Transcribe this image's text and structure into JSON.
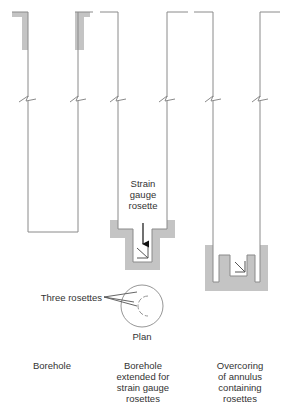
{
  "colors": {
    "line": "#8a8a8a",
    "shade": "#c4c4c4",
    "text": "#333333"
  },
  "labels": {
    "strain_gauge_rosette": [
      "Strain",
      "gauge",
      "rosette"
    ],
    "three_rosettes": "Three rosettes",
    "plan": "Plan"
  },
  "stages": [
    {
      "id": "borehole",
      "caption": [
        "Borehole"
      ]
    },
    {
      "id": "extended",
      "caption": [
        "Borehole",
        "extended for",
        "strain gauge",
        "rosettes"
      ]
    },
    {
      "id": "overcoring",
      "caption": [
        "Overcoring",
        "of annulus",
        "containing",
        "rosettes"
      ]
    }
  ]
}
